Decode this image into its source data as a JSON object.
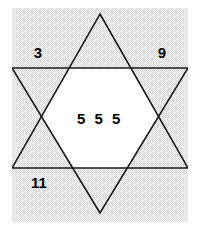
{
  "figure": {
    "kind": "hexagram-diagram",
    "canvas": {
      "width": 201,
      "height": 240,
      "background": "#ffffff"
    },
    "plate": {
      "fill": "#e8e8e8",
      "x": 12,
      "y": 8,
      "width": 176,
      "height": 214
    },
    "stroke_color": "#1a1a1a",
    "stroke_width": 1.6,
    "inner_fill": "#ffffff",
    "triangle_up_points": "100,14 188,168 12,168",
    "triangle_down_points": "100,213 12,68 188,68",
    "hexagon_points": "100,14 188,168 12,168 100,213 12,68 188,68"
  },
  "labels": {
    "top_left": "3",
    "top_right": "9",
    "bottom_left": "11",
    "center": "5 5 5"
  }
}
